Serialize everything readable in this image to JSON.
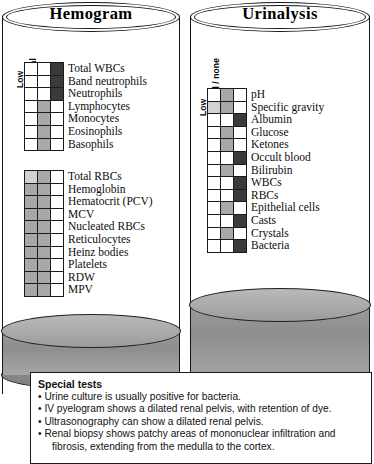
{
  "panels": [
    {
      "title": "Hemogram",
      "columns": [
        "Low",
        "Normal",
        "High"
      ],
      "groups": [
        {
          "rows": [
            {
              "label": "Total WBCs",
              "cells": [
                "none",
                "none",
                "dark"
              ]
            },
            {
              "label": "Band neutrophils",
              "cells": [
                "none",
                "none",
                "dark"
              ]
            },
            {
              "label": "Neutrophils",
              "cells": [
                "none",
                "none",
                "dark"
              ]
            },
            {
              "label": "Lymphocytes",
              "cells": [
                "none",
                "gray",
                "none"
              ]
            },
            {
              "label": "Monocytes",
              "cells": [
                "none",
                "gray",
                "none"
              ]
            },
            {
              "label": "Eosinophils",
              "cells": [
                "none",
                "gray",
                "none"
              ]
            },
            {
              "label": "Basophils",
              "cells": [
                "none",
                "gray",
                "none"
              ]
            }
          ]
        },
        {
          "rows": [
            {
              "label": "Total RBCs",
              "cells": [
                "light",
                "gray",
                "none"
              ]
            },
            {
              "label": "Hemoglobin",
              "cells": [
                "gray",
                "gray",
                "none"
              ]
            },
            {
              "label": "Hematocrit (PCV)",
              "cells": [
                "gray",
                "gray",
                "none"
              ]
            },
            {
              "label": "MCV",
              "cells": [
                "gray",
                "gray",
                "none"
              ]
            },
            {
              "label": "Nucleated RBCs",
              "cells": [
                "gray",
                "gray",
                "none"
              ]
            },
            {
              "label": "Reticulocytes",
              "cells": [
                "gray",
                "gray",
                "none"
              ]
            },
            {
              "label": "Heinz bodies",
              "cells": [
                "gray",
                "gray",
                "none"
              ]
            },
            {
              "label": "Platelets",
              "cells": [
                "gray",
                "gray",
                "none"
              ]
            },
            {
              "label": "RDW",
              "cells": [
                "gray",
                "gray",
                "none"
              ]
            },
            {
              "label": "MPV",
              "cells": [
                "gray",
                "gray",
                "none"
              ]
            }
          ]
        }
      ]
    },
    {
      "title": "Urinalysis",
      "columns": [
        "Low",
        "Normal / none",
        "High"
      ],
      "groups": [
        {
          "rows": [
            {
              "label": "pH",
              "cells": [
                "none",
                "gray",
                "none"
              ]
            },
            {
              "label": "Specific gravity",
              "cells": [
                "light",
                "gray",
                "none"
              ]
            },
            {
              "label": "Albumin",
              "cells": [
                "none",
                "none",
                "dark"
              ]
            },
            {
              "label": "Glucose",
              "cells": [
                "none",
                "gray",
                "none"
              ]
            },
            {
              "label": "Ketones",
              "cells": [
                "none",
                "gray",
                "none"
              ]
            },
            {
              "label": "Occult blood",
              "cells": [
                "none",
                "none",
                "dark"
              ]
            },
            {
              "label": "Bilirubin",
              "cells": [
                "none",
                "gray",
                "none"
              ]
            },
            {
              "label": "WBCs",
              "cells": [
                "none",
                "none",
                "dark"
              ]
            },
            {
              "label": "RBCs",
              "cells": [
                "none",
                "none",
                "dark"
              ]
            },
            {
              "label": "Epithelial cells",
              "cells": [
                "none",
                "gray",
                "none"
              ]
            },
            {
              "label": "Casts",
              "cells": [
                "none",
                "none",
                "dark"
              ]
            },
            {
              "label": "Crystals",
              "cells": [
                "none",
                "gray",
                "none"
              ]
            },
            {
              "label": "Bacteria",
              "cells": [
                "none",
                "none",
                "dark"
              ]
            }
          ]
        }
      ]
    }
  ],
  "special": {
    "heading": "Special tests",
    "items": [
      {
        "text": "Urine culture is usually positive for bacteria.",
        "cont": ""
      },
      {
        "text": "IV pyelogram shows a dilated renal pelvis, with retention of dye.",
        "cont": ""
      },
      {
        "text": "Ultrasonography can show a dilated renal pelvis.",
        "cont": ""
      },
      {
        "text": "Renal biopsy shows patchy areas of mononuclear infiltration and",
        "cont": "fibrosis, extending from the medulla to the cortex."
      }
    ],
    "bullet": "•"
  },
  "colors": {
    "ink": "#151515",
    "fill_light": "#d2d2d2",
    "fill_gray": "#a8a8a8",
    "fill_dark": "#3a3a3a",
    "fluid": "#9a9a9a"
  }
}
